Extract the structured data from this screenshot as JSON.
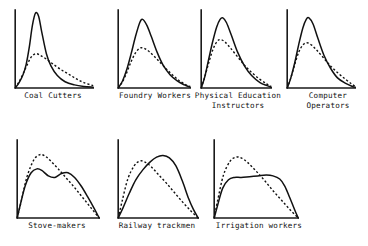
{
  "figure": {
    "title": "",
    "panel_count": 7,
    "rows": 2,
    "line_styles": {
      "solid": "solid",
      "dashed": "dashed"
    },
    "ink_color": "#111111",
    "background_color": "#ffffff"
  },
  "chart_data": {
    "type": "line",
    "title": "",
    "xlabel": "",
    "ylabel": "",
    "grid": false,
    "legend": "none",
    "axes": {
      "x_axis": "horizontal baseline, no tick labels",
      "y_axis": "vertical spine, no tick labels",
      "xlim": [
        0,
        1
      ],
      "ylim": [
        0,
        1
      ]
    },
    "panels": [
      {
        "label": "Coal Cutters",
        "label_lines": [
          "Coal Cutters"
        ],
        "series": [
          {
            "name": "solid",
            "style": "solid",
            "peak_x": 0.26,
            "peak_y": 0.96,
            "shape": "tall narrow right-skewed peak",
            "x": [
              0.0,
              0.05,
              0.1,
              0.14,
              0.18,
              0.22,
              0.26,
              0.3,
              0.34,
              0.4,
              0.46,
              0.54,
              0.64,
              0.76,
              0.88,
              1.0
            ],
            "y": [
              0.0,
              0.07,
              0.17,
              0.3,
              0.52,
              0.8,
              0.96,
              0.92,
              0.72,
              0.44,
              0.28,
              0.16,
              0.08,
              0.04,
              0.02,
              0.01
            ]
          },
          {
            "name": "dashed",
            "style": "dashed",
            "peak_x": 0.26,
            "peak_y": 0.44,
            "shape": "low broad right-skewed peak with long tail",
            "x": [
              0.0,
              0.05,
              0.1,
              0.15,
              0.2,
              0.26,
              0.32,
              0.4,
              0.48,
              0.58,
              0.68,
              0.78,
              0.88,
              1.0
            ],
            "y": [
              0.0,
              0.08,
              0.18,
              0.29,
              0.39,
              0.44,
              0.42,
              0.37,
              0.31,
              0.24,
              0.18,
              0.12,
              0.07,
              0.03
            ]
          }
        ]
      },
      {
        "label": "Foundry Workers",
        "label_lines": [
          "Foundry Workers"
        ],
        "series": [
          {
            "name": "solid",
            "style": "solid",
            "peak_x": 0.34,
            "peak_y": 0.88,
            "shape": "moderate right-skewed peak",
            "x": [
              0.0,
              0.06,
              0.12,
              0.18,
              0.24,
              0.3,
              0.34,
              0.4,
              0.46,
              0.54,
              0.62,
              0.72,
              0.82,
              0.92,
              1.0
            ],
            "y": [
              0.0,
              0.09,
              0.24,
              0.44,
              0.66,
              0.84,
              0.88,
              0.8,
              0.66,
              0.46,
              0.3,
              0.17,
              0.09,
              0.04,
              0.01
            ]
          },
          {
            "name": "dashed",
            "style": "dashed",
            "peak_x": 0.33,
            "peak_y": 0.52,
            "shape": "lower peak, heavier right tail",
            "x": [
              0.0,
              0.06,
              0.12,
              0.18,
              0.24,
              0.3,
              0.36,
              0.44,
              0.54,
              0.64,
              0.74,
              0.84,
              0.94,
              1.0
            ],
            "y": [
              0.0,
              0.08,
              0.2,
              0.34,
              0.45,
              0.51,
              0.51,
              0.46,
              0.37,
              0.27,
              0.18,
              0.1,
              0.04,
              0.02
            ]
          }
        ]
      },
      {
        "label": "Physical Education Instructors",
        "label_lines": [
          "Physical Education",
          "Instructors"
        ],
        "series": [
          {
            "name": "solid",
            "style": "solid",
            "peak_x": 0.3,
            "peak_y": 0.9,
            "shape": "right-skewed peak",
            "x": [
              0.0,
              0.05,
              0.1,
              0.16,
              0.22,
              0.27,
              0.31,
              0.36,
              0.43,
              0.52,
              0.62,
              0.72,
              0.84,
              0.94,
              1.0
            ],
            "y": [
              0.0,
              0.14,
              0.34,
              0.58,
              0.78,
              0.88,
              0.9,
              0.84,
              0.68,
              0.46,
              0.28,
              0.16,
              0.07,
              0.03,
              0.01
            ]
          },
          {
            "name": "dashed",
            "style": "dashed",
            "peak_x": 0.28,
            "peak_y": 0.62,
            "shape": "lower, broader peak with long tail",
            "x": [
              0.0,
              0.05,
              0.11,
              0.17,
              0.23,
              0.28,
              0.34,
              0.42,
              0.52,
              0.62,
              0.72,
              0.84,
              0.94,
              1.0
            ],
            "y": [
              0.0,
              0.14,
              0.33,
              0.5,
              0.6,
              0.62,
              0.59,
              0.51,
              0.4,
              0.29,
              0.2,
              0.11,
              0.05,
              0.02
            ]
          }
        ]
      },
      {
        "label": "Computer Operators",
        "label_lines": [
          "Computer",
          "Operators"
        ],
        "series": [
          {
            "name": "solid",
            "style": "solid",
            "peak_x": 0.3,
            "peak_y": 0.9,
            "shape": "right-skewed peak",
            "x": [
              0.0,
              0.05,
              0.11,
              0.17,
              0.23,
              0.28,
              0.32,
              0.38,
              0.45,
              0.54,
              0.64,
              0.74,
              0.86,
              0.96,
              1.0
            ],
            "y": [
              0.0,
              0.12,
              0.32,
              0.56,
              0.77,
              0.88,
              0.9,
              0.82,
              0.64,
              0.42,
              0.25,
              0.13,
              0.06,
              0.02,
              0.01
            ]
          },
          {
            "name": "dashed",
            "style": "dashed",
            "peak_x": 0.28,
            "peak_y": 0.58,
            "shape": "lower peak with extended right tail",
            "x": [
              0.0,
              0.05,
              0.11,
              0.17,
              0.23,
              0.29,
              0.36,
              0.44,
              0.54,
              0.64,
              0.75,
              0.86,
              0.95,
              1.0
            ],
            "y": [
              0.0,
              0.12,
              0.3,
              0.46,
              0.55,
              0.58,
              0.55,
              0.48,
              0.38,
              0.28,
              0.19,
              0.11,
              0.05,
              0.02
            ]
          }
        ]
      },
      {
        "label": "Stove-makers",
        "label_lines": [
          "Stove-makers"
        ],
        "series": [
          {
            "name": "solid",
            "style": "solid",
            "peak_x": 0.27,
            "peak_y": 0.63,
            "shape": "bimodal broad plateau with two humps",
            "x": [
              0.0,
              0.04,
              0.1,
              0.17,
              0.24,
              0.3,
              0.38,
              0.46,
              0.54,
              0.62,
              0.7,
              0.78,
              0.86,
              0.94,
              1.0
            ],
            "y": [
              0.0,
              0.18,
              0.42,
              0.58,
              0.63,
              0.61,
              0.54,
              0.52,
              0.57,
              0.58,
              0.52,
              0.41,
              0.27,
              0.12,
              0.0
            ]
          },
          {
            "name": "dashed",
            "style": "dashed",
            "peak_x": 0.3,
            "peak_y": 0.82,
            "shape": "single early peak declining steadily to zero",
            "x": [
              0.0,
              0.05,
              0.12,
              0.2,
              0.27,
              0.33,
              0.4,
              0.5,
              0.6,
              0.7,
              0.8,
              0.9,
              1.0
            ],
            "y": [
              0.0,
              0.22,
              0.53,
              0.74,
              0.81,
              0.8,
              0.74,
              0.63,
              0.51,
              0.39,
              0.26,
              0.13,
              0.0
            ]
          }
        ]
      },
      {
        "label": "Railway trackmen",
        "label_lines": [
          "Railway trackmen"
        ],
        "series": [
          {
            "name": "solid",
            "style": "solid",
            "peak_x": 0.56,
            "peak_y": 0.8,
            "shape": "broad late-peaking mound",
            "x": [
              0.0,
              0.06,
              0.14,
              0.22,
              0.31,
              0.4,
              0.48,
              0.56,
              0.64,
              0.72,
              0.8,
              0.88,
              0.94,
              1.0
            ],
            "y": [
              0.0,
              0.13,
              0.32,
              0.49,
              0.62,
              0.72,
              0.78,
              0.8,
              0.77,
              0.67,
              0.48,
              0.25,
              0.11,
              0.0
            ]
          },
          {
            "name": "dashed",
            "style": "dashed",
            "peak_x": 0.3,
            "peak_y": 0.73,
            "shape": "early peak then steady decline",
            "x": [
              0.0,
              0.05,
              0.12,
              0.2,
              0.27,
              0.33,
              0.41,
              0.5,
              0.6,
              0.7,
              0.8,
              0.9,
              1.0
            ],
            "y": [
              0.0,
              0.22,
              0.5,
              0.67,
              0.73,
              0.72,
              0.66,
              0.56,
              0.45,
              0.33,
              0.21,
              0.1,
              0.0
            ]
          }
        ]
      },
      {
        "label": "Irrigation workers",
        "label_lines": [
          "Irrigation workers"
        ],
        "series": [
          {
            "name": "solid",
            "style": "solid",
            "peak_x": 0.6,
            "peak_y": 0.55,
            "shape": "flat-topped plateau with steep shoulders",
            "x": [
              0.0,
              0.04,
              0.1,
              0.17,
              0.24,
              0.32,
              0.42,
              0.52,
              0.62,
              0.7,
              0.78,
              0.84,
              0.9,
              0.96,
              1.0
            ],
            "y": [
              0.0,
              0.16,
              0.38,
              0.49,
              0.52,
              0.52,
              0.53,
              0.54,
              0.55,
              0.54,
              0.5,
              0.41,
              0.26,
              0.1,
              0.0
            ]
          },
          {
            "name": "dashed",
            "style": "dashed",
            "peak_x": 0.3,
            "peak_y": 0.78,
            "shape": "early peak declining to zero at right",
            "x": [
              0.0,
              0.04,
              0.11,
              0.19,
              0.26,
              0.32,
              0.4,
              0.5,
              0.6,
              0.7,
              0.8,
              0.9,
              1.0
            ],
            "y": [
              0.0,
              0.22,
              0.55,
              0.73,
              0.78,
              0.77,
              0.71,
              0.6,
              0.48,
              0.35,
              0.23,
              0.11,
              0.0
            ]
          }
        ]
      }
    ]
  }
}
